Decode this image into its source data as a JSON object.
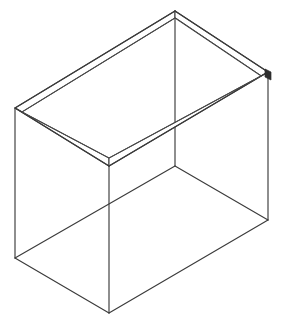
{
  "document": {
    "title": "Isometric Box Line Drawing",
    "subject": "open-top rectangular box",
    "projection": "isometric wireframe",
    "background_color": "#ffffff",
    "line_color": "#3b3b3b",
    "accent_color": "#2e2e2e",
    "canvas": {
      "width": 283,
      "height": 325
    }
  },
  "geometry": {
    "description": "Open-top rectangular box drawn in isometric projection with visible wall thickness along the top rim.",
    "units": "pixels",
    "top_rim_outer": {
      "back": {
        "x": 175,
        "y": 11
      },
      "left": {
        "x": 15,
        "y": 108
      },
      "front": {
        "x": 109,
        "y": 166
      },
      "right": {
        "x": 268,
        "y": 72
      }
    },
    "top_rim_inner": {
      "back": {
        "x": 175,
        "y": 18
      },
      "left": {
        "x": 22,
        "y": 112
      },
      "front": {
        "x": 109,
        "y": 158
      },
      "right": {
        "x": 261,
        "y": 76
      }
    },
    "bottom_outer": {
      "left": {
        "x": 15,
        "y": 258
      },
      "front": {
        "x": 109,
        "y": 313
      },
      "right": {
        "x": 268,
        "y": 220
      }
    },
    "floor_interior": {
      "back": {
        "x": 175,
        "y": 166
      },
      "left": {
        "x": 15,
        "y": 258
      },
      "front": {
        "x": 109,
        "y": 313
      },
      "right": {
        "x": 268,
        "y": 220
      }
    },
    "vertical_edges": [
      {
        "name": "left-vertical",
        "top": {
          "x": 15,
          "y": 108
        },
        "bottom": {
          "x": 15,
          "y": 258
        }
      },
      {
        "name": "front-vertical",
        "top": {
          "x": 109,
          "y": 166
        },
        "bottom": {
          "x": 109,
          "y": 313
        }
      },
      {
        "name": "right-vertical",
        "top": {
          "x": 268,
          "y": 72
        },
        "bottom": {
          "x": 268,
          "y": 220
        }
      },
      {
        "name": "back-vertical",
        "top": {
          "x": 175,
          "y": 11
        },
        "bottom": {
          "x": 175,
          "y": 166
        }
      }
    ],
    "wall_thickness_px": 7
  },
  "paths": {
    "rim_outer": "M175,11 L15,108 L109,166 L268,72 Z",
    "rim_inner": "M175,18 L22,112 L109,158 L261,76 Z",
    "rim_band_left": "M15,108 L109,166 L109,158 L22,112 Z",
    "rim_band_right": "M109,166 L268,72 L261,76 L109,158 Z",
    "rim_band_back_left": "M175,11 L15,108 L22,112 L175,18 Z",
    "rim_band_back_right": "M175,11 L268,72 L261,76 L175,18 Z",
    "left_vertical": "M15,108 L15,258",
    "front_vertical": "M109,166 L109,313",
    "right_vertical": "M268,72 L268,220",
    "back_vertical": "M175,11 L175,166",
    "floor_left": "M15,258 L109,313",
    "floor_right": "M109,313 L268,220",
    "floor_back_left": "M15,258 L175,166",
    "floor_back_right": "M268,220 L175,166",
    "corner_tick_right": "M265,69 L271,72 L271,80 L265,77 Z"
  },
  "labels": {
    "none_visible": ""
  }
}
